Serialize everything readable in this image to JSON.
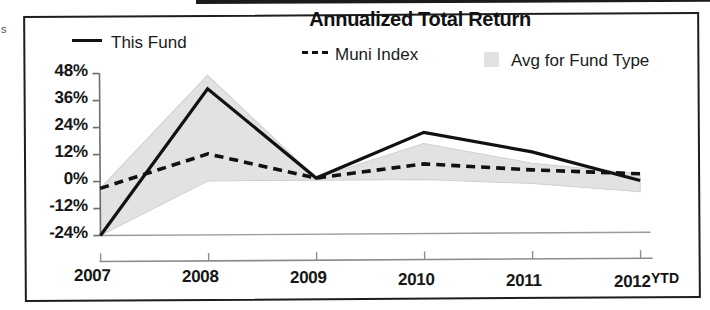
{
  "page": {
    "scan_margin_mark": "s"
  },
  "chart": {
    "title": "Annualized Total Return",
    "x_axis_suffix": "YTD",
    "legend": [
      {
        "label": "This Fund",
        "marker": "solid-line-swatch",
        "color": "#111111"
      },
      {
        "label": "Muni Index",
        "marker": "dashed-line-swatch",
        "color": "#111111"
      },
      {
        "label": "Avg for Fund Type",
        "marker": "area-swatch",
        "color": "#e2e2e2"
      }
    ]
  },
  "chart_data": {
    "type": "line",
    "title": "Annualized Total Return",
    "xlabel": "",
    "ylabel": "",
    "categories": [
      "2007",
      "2008",
      "2009",
      "2010",
      "2011",
      "2012"
    ],
    "x_tick_labels": [
      "2007",
      "2008",
      "2009",
      "2010",
      "2011",
      "2012"
    ],
    "y_tick_labels": [
      "48%",
      "36%",
      "24%",
      "12%",
      "0%",
      "-12%",
      "-24%"
    ],
    "y_ticks": [
      48,
      36,
      24,
      12,
      0,
      -12,
      -24
    ],
    "ylim": [
      -24,
      48
    ],
    "grid": false,
    "legend_position": "top",
    "note": "Final x point is 2012 YTD (partial year)",
    "series": [
      {
        "name": "This Fund",
        "style": "solid",
        "color": "#111111",
        "values": [
          -24,
          41,
          1,
          21,
          12,
          -1
        ]
      },
      {
        "name": "Muni Index",
        "style": "dashed",
        "color": "#111111",
        "values": [
          -3,
          12,
          1,
          7,
          4,
          2
        ]
      },
      {
        "name": "Avg for Fund Type",
        "style": "band",
        "color": "#e2e2e2",
        "upper": [
          -3,
          47,
          1,
          16,
          7,
          2
        ],
        "lower": [
          -24,
          0,
          0,
          0,
          -2,
          -6
        ]
      }
    ]
  }
}
